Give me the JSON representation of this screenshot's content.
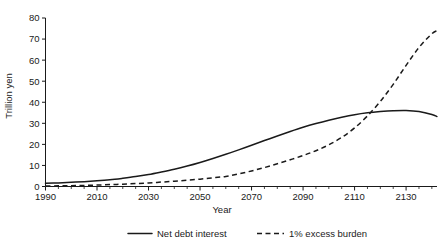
{
  "chart_data": {
    "type": "line",
    "title": "",
    "xlabel": "Year",
    "ylabel": "Trillion yen",
    "xlim": [
      1990,
      2142
    ],
    "ylim": [
      0,
      80
    ],
    "grid": false,
    "legend_position": "bottom",
    "x_ticks": [
      1990,
      2010,
      2030,
      2050,
      2070,
      2090,
      2110,
      2130
    ],
    "x_tick_labels": [
      "1990",
      "2010",
      "2030",
      "2050",
      "2070",
      "2090",
      "2110",
      "2130"
    ],
    "x_minor_interval": 5,
    "y_ticks": [
      0,
      10,
      20,
      30,
      40,
      50,
      60,
      70,
      80
    ],
    "y_tick_labels": [
      "0",
      "10",
      "20",
      "30",
      "40",
      "50",
      "60",
      "70",
      "80"
    ],
    "x": [
      1990,
      1995,
      2000,
      2005,
      2010,
      2015,
      2020,
      2025,
      2030,
      2035,
      2040,
      2045,
      2050,
      2055,
      2060,
      2065,
      2070,
      2075,
      2080,
      2085,
      2090,
      2095,
      2100,
      2105,
      2110,
      2115,
      2120,
      2125,
      2130,
      2135,
      2140,
      2142
    ],
    "series": [
      {
        "name": "Net debt interest",
        "style": "solid",
        "color": "#1a1a1a",
        "values": [
          1.5,
          1.7,
          2.0,
          2.3,
          2.7,
          3.2,
          3.9,
          4.7,
          5.7,
          6.9,
          8.2,
          9.7,
          11.4,
          13.3,
          15.3,
          17.4,
          19.6,
          21.8,
          24.0,
          26.1,
          28.1,
          29.9,
          31.5,
          32.9,
          34.1,
          35.0,
          35.6,
          36.0,
          36.1,
          35.6,
          34.2,
          33.2
        ]
      },
      {
        "name": "1% excess burden",
        "style": "dashed",
        "color": "#1a1a1a",
        "values": [
          0.2,
          0.3,
          0.4,
          0.5,
          0.7,
          0.9,
          1.1,
          1.4,
          1.7,
          2.1,
          2.5,
          3.0,
          3.5,
          4.1,
          4.8,
          6.0,
          7.4,
          9.0,
          10.8,
          12.7,
          14.7,
          17.0,
          19.8,
          23.3,
          27.8,
          33.5,
          40.4,
          48.5,
          57.5,
          66.0,
          72.5,
          74.0
        ]
      }
    ],
    "legend": [
      {
        "label": "Net debt interest",
        "style": "solid"
      },
      {
        "label": "1% excess burden",
        "style": "dashed"
      }
    ]
  }
}
